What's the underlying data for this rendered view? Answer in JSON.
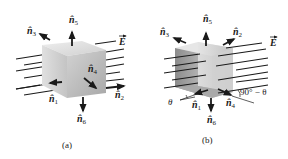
{
  "figure_a": {
    "caption": "(a)",
    "field_label": "E",
    "normals": [
      {
        "id": "n1",
        "base": "n",
        "sub": "1"
      },
      {
        "id": "n2",
        "base": "n",
        "sub": "2"
      },
      {
        "id": "n3",
        "base": "n",
        "sub": "3"
      },
      {
        "id": "n4",
        "base": "n",
        "sub": "4"
      },
      {
        "id": "n5",
        "base": "n",
        "sub": "5"
      },
      {
        "id": "n6",
        "base": "n",
        "sub": "6"
      }
    ]
  },
  "figure_b": {
    "caption": "(b)",
    "field_label": "E",
    "angle_theta": "θ",
    "angle_complement": "90° − θ",
    "normals": [
      {
        "id": "n1",
        "base": "n",
        "sub": "1"
      },
      {
        "id": "n2",
        "base": "n",
        "sub": "2"
      },
      {
        "id": "n3",
        "base": "n",
        "sub": "3"
      },
      {
        "id": "n4",
        "base": "n",
        "sub": "4"
      },
      {
        "id": "n5",
        "base": "n",
        "sub": "5"
      },
      {
        "id": "n6",
        "base": "n",
        "sub": "6"
      }
    ]
  },
  "colors": {
    "line": "#1a1a1a",
    "cube_light": "#e6e6e6",
    "cube_mid": "#c8c8c8",
    "cube_dark": "#a9a9a9"
  }
}
